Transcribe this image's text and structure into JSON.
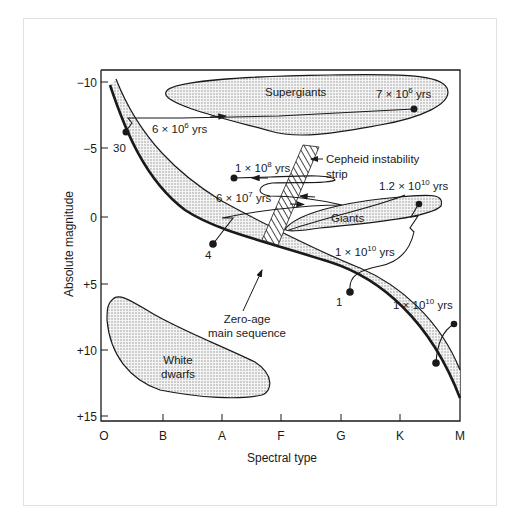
{
  "diagram": {
    "type": "Hertzsprung-Russell diagram with stellar evolution tracks",
    "x_axis": {
      "title": "Spectral type",
      "ticks": [
        "O",
        "B",
        "A",
        "F",
        "G",
        "K",
        "M"
      ]
    },
    "y_axis": {
      "title": "Absolute magnitude",
      "ticks": [
        "−10",
        "−5",
        "0",
        "+5",
        "+10",
        "+15"
      ]
    },
    "regions": {
      "supergiants": "Supergiants",
      "giants": "Giants",
      "white_dwarfs_line1": "White",
      "white_dwarfs_line2": "dwarfs",
      "cepheid_line1": "Cepheid instability",
      "cepheid_line2": "strip",
      "zams_line1": "Zero-age",
      "zams_line2": "main sequence"
    },
    "mass_labels": {
      "m30": "30",
      "m4": "4",
      "m1": "1"
    },
    "age_labels": {
      "a1": {
        "base": "6 × 10",
        "exp": "6",
        "unit": " yrs"
      },
      "a2": {
        "base": "7 × 10",
        "exp": "6",
        "unit": " yrs"
      },
      "a3": {
        "base": "1 × 10",
        "exp": "8",
        "unit": " yrs"
      },
      "a4": {
        "base": "6 × 10",
        "exp": "7",
        "unit": " yrs"
      },
      "a5": {
        "base": "1.2 × 10",
        "exp": "10",
        "unit": " yrs"
      },
      "a6": {
        "base": "1 × 10",
        "exp": "10",
        "unit": " yrs"
      },
      "a7": {
        "base": "1 × 10",
        "exp": "10",
        "unit": " yrs"
      }
    },
    "colors": {
      "ink": "#1a1a1a",
      "stipple": "#cfcfcf",
      "frame": "#e2e2e2"
    }
  }
}
